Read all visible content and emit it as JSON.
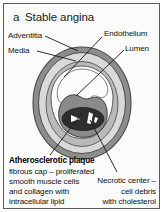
{
  "figure": {
    "panel_letter": "a",
    "title": "Stable angina",
    "frame_color": "#5d5d5d",
    "background": "#fbfbfb"
  },
  "labels": {
    "adventitia": "Adventitia",
    "media": "Media",
    "endothelium": "Endothelium",
    "lumen": "Lumen"
  },
  "plaque": {
    "heading": "Atherosclerotic plaque",
    "line1": "fibrous cap – proliferated",
    "line2": "smooth muscle cells",
    "line3": "and collagen with",
    "line4": "intracellular lipid"
  },
  "necrotic": {
    "line1": "Necrotic center –",
    "line2": "cell debris",
    "line3": "with cholesterol"
  },
  "colors": {
    "adventitia_fill": "#8d8d8d",
    "media_fill": "#d5d5d5",
    "intima_fill": "#b4b4b4",
    "lumen_fill": "#fdfdfd",
    "plaque_cap_fill": "#8a8a8a",
    "necrotic_core_fill": "#2e2e2e",
    "cholesterol_cleft_fill": "#ffffff",
    "leader_line": "#1a1a1a",
    "outline": "#4a4a4a"
  }
}
